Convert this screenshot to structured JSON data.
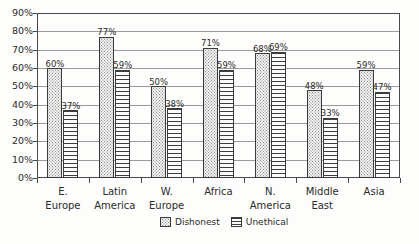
{
  "chart_data": {
    "type": "bar",
    "title": "",
    "subtitle": "",
    "xlabel": "",
    "ylabel": "",
    "ylim": [
      0,
      90
    ],
    "ytick_labels": [
      "0%",
      "10%",
      "20%",
      "30%",
      "40%",
      "50%",
      "60%",
      "70%",
      "80%",
      "90%"
    ],
    "ytick_values": [
      0,
      10,
      20,
      30,
      40,
      50,
      60,
      70,
      80,
      90
    ],
    "grid": true,
    "legend_position": "bottom-right",
    "categories": [
      "E. Europe",
      "Latin America",
      "W. Europe",
      "Africa",
      "N. America",
      "Middle East",
      "Asia"
    ],
    "category_lines": [
      [
        "E.",
        "Europe"
      ],
      [
        "Latin",
        "America"
      ],
      [
        "W.",
        "Europe"
      ],
      [
        "Africa",
        ""
      ],
      [
        "N.",
        "America"
      ],
      [
        "Middle",
        "East"
      ],
      [
        "Asia",
        ""
      ]
    ],
    "series": [
      {
        "name": "Dishonest",
        "values": [
          60,
          77,
          50,
          71,
          68,
          48,
          59
        ],
        "labels": [
          "60%",
          "77%",
          "50%",
          "71%",
          "68%",
          "48%",
          "59%"
        ],
        "pattern": "dotted",
        "color": "#f0f0ee"
      },
      {
        "name": "Unethical",
        "values": [
          37,
          59,
          38,
          59,
          69,
          33,
          47
        ],
        "labels": [
          "37%",
          "59%",
          "38%",
          "59%",
          "69%",
          "33%",
          "47%"
        ],
        "pattern": "horizontal-hatch",
        "color": "#fbfbfa"
      }
    ]
  },
  "legend": {
    "entries": [
      {
        "label": "Dishonest"
      },
      {
        "label": "Unethical"
      }
    ]
  },
  "colors": {
    "axis": "#4a4a4a",
    "gridline": "#9a9a9a",
    "text": "#2b2b2b",
    "background": "#fdfdfb",
    "bar_border": "#3a3a3a"
  }
}
